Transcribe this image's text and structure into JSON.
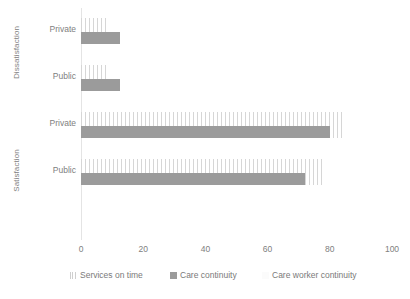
{
  "chart_data": {
    "type": "bar",
    "orientation": "horizontal",
    "title": "",
    "xlabel": "",
    "ylabel": "",
    "xlim": [
      0,
      100
    ],
    "xticks": [
      "0",
      "20",
      "40",
      "60",
      "80",
      "100"
    ],
    "grid": false,
    "legend_position": "bottom",
    "groups": [
      {
        "name": "Dissatisfaction",
        "categories": [
          "Private",
          "Public"
        ]
      },
      {
        "name": "Satisfaction",
        "categories": [
          "Private",
          "Public"
        ]
      }
    ],
    "categories": [
      "Dissatisfaction / Private",
      "Dissatisfaction / Public",
      "Satisfaction / Private",
      "Satisfaction / Public"
    ],
    "series": [
      {
        "name": "Services on time",
        "color": "#d6d6d6",
        "values": [
          8,
          9,
          85,
          78
        ]
      },
      {
        "name": "Care continuity",
        "color": "#9b9b9b",
        "values": [
          12.5,
          12.5,
          80,
          72
        ]
      },
      {
        "name": "Care worker continuity",
        "color": "#fdfdfd",
        "values": [
          0,
          0,
          0,
          0
        ]
      }
    ]
  },
  "axis": {
    "ticks": [
      {
        "label": "0",
        "value": 0
      },
      {
        "label": "20",
        "value": 20
      },
      {
        "label": "40",
        "value": 40
      },
      {
        "label": "60",
        "value": 60
      },
      {
        "label": "80",
        "value": 80
      },
      {
        "label": "100",
        "value": 100
      }
    ]
  },
  "group_labels": {
    "dissatisfaction": "Dissatisfaction",
    "satisfaction": "Satisfaction"
  },
  "category_labels": {
    "dis_private": "Private",
    "dis_public": "Public",
    "sat_private": "Private",
    "sat_public": "Public"
  },
  "legend": {
    "items": [
      {
        "label": "Services on time",
        "color": "#d6d6d6",
        "marker": "striped-square-icon"
      },
      {
        "label": "Care continuity",
        "color": "#9b9b9b",
        "marker": "solid-square-icon"
      },
      {
        "label": "Care worker continuity",
        "color": "#fdfdfd",
        "marker": "faint-square-icon"
      }
    ]
  }
}
